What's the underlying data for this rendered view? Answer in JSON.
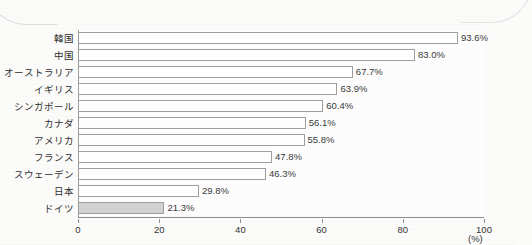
{
  "chart_data": {
    "type": "bar",
    "orientation": "horizontal",
    "title": "",
    "xlabel": "(%)",
    "ylabel": "",
    "xlim": [
      0,
      100
    ],
    "xticks": [
      "0",
      "20",
      "40",
      "60",
      "80",
      "100"
    ],
    "grid": false,
    "legend": null,
    "unit_label": "(%)",
    "categories": [
      "韓国",
      "中国",
      "オーストラリア",
      "イギリス",
      "シンガポール",
      "カナダ",
      "アメリカ",
      "フランス",
      "スウェーデン",
      "日本",
      "ドイツ"
    ],
    "values": [
      93.6,
      83.0,
      67.7,
      63.9,
      60.4,
      56.1,
      55.8,
      47.8,
      46.3,
      29.8,
      21.3
    ],
    "value_labels": [
      "93.6%",
      "83.0%",
      "67.7%",
      "63.9%",
      "60.4%",
      "56.1%",
      "55.8%",
      "47.8%",
      "46.3%",
      "29.8%",
      "21.3%"
    ],
    "highlighted_category": "ドイツ",
    "bar_fill": "#ffffff",
    "bar_fill_highlight": "#d2d2d2",
    "bar_border": "#9e9e9e"
  }
}
